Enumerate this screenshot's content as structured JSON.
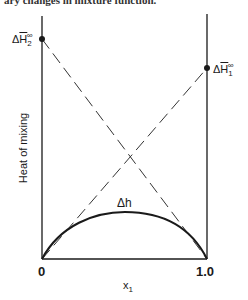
{
  "top_text": "ary changes in mixture function.",
  "diagram": {
    "y_axis_label": "Heat of mixing",
    "x_axis_label": "x",
    "x_axis_label_sub": "1",
    "x_ticks": [
      "0",
      "1.0"
    ],
    "left_point_label": {
      "prefix": "Δ",
      "symbol": "H",
      "sub": "2",
      "sup": "∞"
    },
    "right_point_label": {
      "prefix": "Δ",
      "symbol": "H",
      "sub": "1",
      "sup": "∞"
    },
    "curve_label": "Δh",
    "colors": {
      "line": "#1a1a1a",
      "background": "#ffffff"
    }
  }
}
